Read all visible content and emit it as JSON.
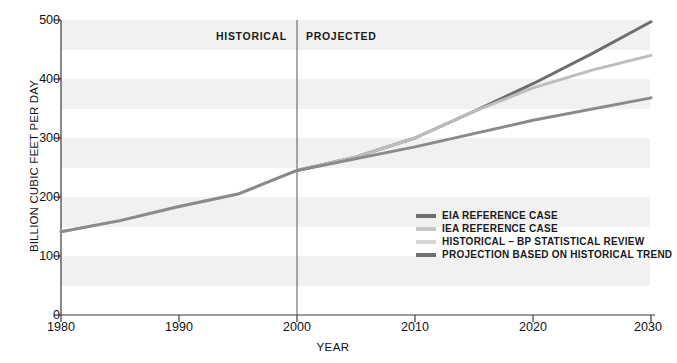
{
  "chart_data": {
    "type": "line",
    "title": "",
    "xlabel": "YEAR",
    "ylabel": "BILLION CUBIC FEET PER DAY",
    "xlim": [
      1980,
      2030
    ],
    "ylim": [
      0,
      500
    ],
    "xticks": [
      "1980",
      "1990",
      "2000",
      "2010",
      "2020",
      "2030"
    ],
    "yticks": [
      "0",
      "100",
      "200",
      "300",
      "400",
      "500"
    ],
    "grid": "horizontal-bands",
    "legend_position": "inside-right-middle",
    "annotations": [
      {
        "text": "HISTORICAL",
        "x": 2000,
        "align": "right"
      },
      {
        "text": "PROJECTED",
        "x": 2000,
        "align": "left"
      }
    ],
    "divider_x": 2000,
    "series": [
      {
        "name": "EIA REFERENCE CASE",
        "color": "#6e6e6e",
        "x": [
          2000,
          2005,
          2010,
          2015,
          2020,
          2025,
          2030
        ],
        "values": [
          245,
          268,
          300,
          345,
          392,
          443,
          497
        ]
      },
      {
        "name": "IEA REFERENCE CASE",
        "color": "#bdbdbd",
        "x": [
          2000,
          2005,
          2010,
          2015,
          2020,
          2025,
          2030
        ],
        "values": [
          245,
          268,
          300,
          345,
          385,
          415,
          440
        ]
      },
      {
        "name": "HISTORICAL – BP STATISTICAL REVIEW",
        "color": "#d2d2d2",
        "x": [
          1980,
          1985,
          1990,
          1995,
          2000
        ],
        "values": [
          141,
          160,
          184,
          205,
          245
        ]
      },
      {
        "name": "PROJECTION BASED ON HISTORICAL TREND",
        "color": "#8a8a8a",
        "x": [
          1980,
          1985,
          1990,
          1995,
          2000,
          2010,
          2020,
          2030
        ],
        "values": [
          141,
          160,
          184,
          205,
          245,
          285,
          330,
          368
        ]
      }
    ]
  },
  "axis": {
    "y_title": "BILLION CUBIC FEET PER DAY",
    "x_title": "YEAR",
    "y_ticks": [
      "500",
      "400",
      "300",
      "200",
      "100",
      "0"
    ],
    "x_ticks": [
      "1980",
      "1990",
      "2000",
      "2010",
      "2020",
      "2030"
    ]
  },
  "annotations": {
    "historical": "HISTORICAL",
    "projected": "PROJECTED"
  },
  "legend": {
    "items": [
      {
        "label": "EIA REFERENCE CASE",
        "color": "#6e6e6e"
      },
      {
        "label": "IEA REFERENCE CASE",
        "color": "#c6c6c6"
      },
      {
        "label": "HISTORICAL – BP STATISTICAL REVIEW",
        "color": "#d6d6d6"
      },
      {
        "label": "PROJECTION BASED ON HISTORICAL TREND",
        "color": "#707070"
      }
    ]
  },
  "colors": {
    "band": "#f0f0f0",
    "axis": "#3b3b3b",
    "text": "#1a1a1a"
  }
}
